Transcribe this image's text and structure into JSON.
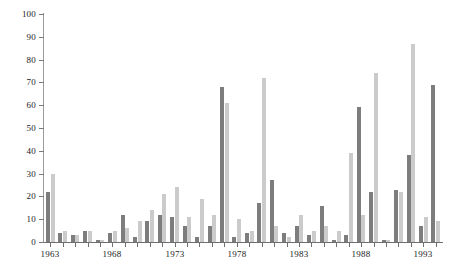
{
  "chart_data": {
    "type": "bar",
    "title": "",
    "subtitle": "",
    "xlabel": "",
    "ylabel": "",
    "ylim": [
      0,
      100
    ],
    "ytick_values": [
      0,
      10,
      20,
      30,
      40,
      50,
      60,
      70,
      80,
      90,
      100
    ],
    "ytick_labels": [
      "0",
      "10",
      "20",
      "30",
      "40",
      "50",
      "60",
      "70",
      "80",
      "90",
      "100"
    ],
    "grid": false,
    "legend": "none",
    "categories": [
      "1963",
      "1964",
      "1965",
      "1966",
      "1967",
      "1968",
      "1969",
      "1970",
      "1971",
      "1972",
      "1973",
      "1974",
      "1975",
      "1976",
      "1977",
      "1978",
      "1979",
      "1980",
      "1981",
      "1982",
      "1983",
      "1984",
      "1985",
      "1986",
      "1987",
      "1988",
      "1989",
      "1990",
      "1991",
      "1992",
      "1993",
      "1994"
    ],
    "xtick_labeled": [
      "1963",
      "1968",
      "1973",
      "1978",
      "1983",
      "1988",
      "1993"
    ],
    "series": [
      {
        "name": "series-1",
        "color": "#7d7d7d",
        "values": [
          22,
          4,
          3,
          5,
          1,
          4,
          12,
          2,
          9,
          12,
          11,
          7,
          2,
          7,
          68,
          2,
          4,
          17,
          27,
          4,
          7,
          3,
          16,
          1,
          3,
          59,
          22,
          1,
          23,
          38,
          7,
          69
        ]
      },
      {
        "name": "series-2",
        "color": "#cbcbcb",
        "values": [
          30,
          5,
          3,
          5,
          1,
          5,
          6,
          9,
          14,
          21,
          24,
          11,
          19,
          12,
          61,
          10,
          5,
          72,
          7,
          2,
          12,
          5,
          7,
          5,
          39,
          12,
          74,
          1,
          22,
          87,
          11,
          9
        ]
      }
    ]
  }
}
